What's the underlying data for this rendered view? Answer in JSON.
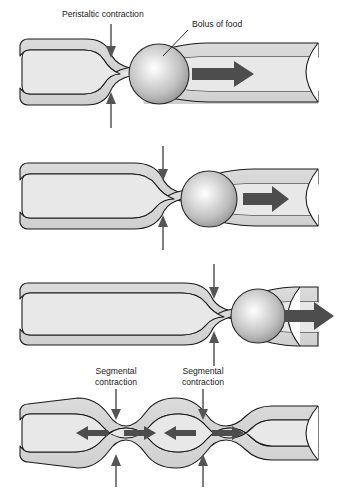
{
  "figure": {
    "background_color": "#ffffff",
    "line_color": "#1a1a1a",
    "lumen_fill": "#e3e3e3",
    "wall_fill": "#d2d2d2",
    "arrow_color": "#4d4d4d",
    "thin_arrow_color": "#555555",
    "bolus_highlight": "#ffffff",
    "bolus_mid": "#c9c9c9",
    "bolus_edge": "#8e8e8e"
  },
  "labels": {
    "peristaltic_contraction": "Peristaltic contraction",
    "bolus_of_food": "Bolus of food",
    "segmental_contraction_left_line1": "Segmental",
    "segmental_contraction_left_line2": "contraction",
    "segmental_contraction_right_line1": "Segmental",
    "segmental_contraction_right_line2": "contraction"
  },
  "panels": [
    {
      "id": "panel-1",
      "name": "peristalsis-stage-1",
      "description": "Peristaltic contraction behind bolus near left of tube",
      "constriction_x": 110,
      "bolus_center_x": 159,
      "bolus_radius": 30,
      "bulk_arrow_label": "propulsion-arrow",
      "bulk_arrow_x": 192,
      "bulk_arrow_length": 62,
      "has_labels": true
    },
    {
      "id": "panel-2",
      "name": "peristalsis-stage-2",
      "description": "Contraction moved rightward, bolus advanced",
      "constriction_x": 162,
      "bolus_center_x": 209,
      "bolus_radius": 28,
      "bulk_arrow_label": "propulsion-arrow",
      "bulk_arrow_x": 243,
      "bulk_arrow_length": 46,
      "has_labels": false
    },
    {
      "id": "panel-3",
      "name": "peristalsis-stage-3",
      "description": "Contraction near right, bolus exiting tube",
      "constriction_x": 213,
      "bolus_center_x": 258,
      "bolus_radius": 27,
      "bulk_arrow_label": "propulsion-arrow",
      "bulk_arrow_x": 288,
      "bulk_arrow_length": 46,
      "has_labels": false
    },
    {
      "id": "panel-4",
      "name": "segmentation",
      "description": "Two segmental contractions mixing contents bidirectionally",
      "constriction_x_left": 115,
      "constriction_x_right": 202,
      "has_labels": true
    }
  ],
  "arrows": {
    "peristaltic_down_arrow": "down-arrow",
    "peristaltic_up_arrow": "up-arrow",
    "segmental_down_arrow": "down-arrow",
    "segmental_up_arrow": "up-arrow",
    "mixing_arrow_left": "left-arrow",
    "mixing_arrow_right": "right-arrow",
    "propulsion_arrow": "right-arrow"
  }
}
